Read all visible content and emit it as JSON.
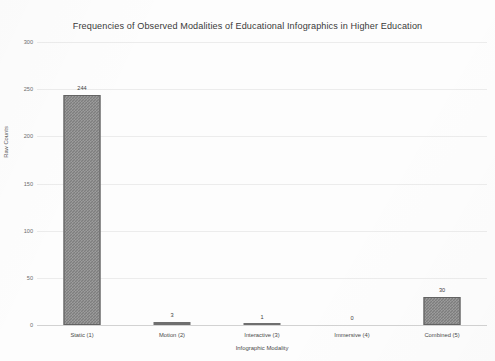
{
  "chart_data": {
    "type": "bar",
    "title": "Frequencies of Observed Modalities of Educational Infographics in Higher Education",
    "xlabel": "Infographic  Modality",
    "ylabel": "Raw Counts",
    "categories": [
      "Static (1)",
      "Motion (2)",
      "Interactive (3)",
      "Immersive (4)",
      "Combined  (5)"
    ],
    "values": [
      244,
      3,
      1,
      0,
      30
    ],
    "value_labels": [
      "244",
      "3",
      "1",
      "0",
      "30"
    ],
    "ylim": [
      0,
      300
    ],
    "yticks": [
      0,
      50,
      100,
      150,
      200,
      250,
      300
    ],
    "ytick_labels": [
      "0",
      "50",
      "100",
      "150",
      "200",
      "250",
      "300"
    ],
    "grid": true,
    "legend": false,
    "series_color": "#7e7e7e",
    "background": "#ffffff"
  }
}
